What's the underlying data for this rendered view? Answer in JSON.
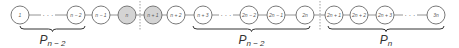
{
  "diagram": {
    "type": "path-graph",
    "node_radius": 9,
    "center_y": 15,
    "nodes": [
      {
        "label": "1",
        "x": 20,
        "shaded": false
      },
      {
        "label": "n − 2",
        "x": 76,
        "shaded": false
      },
      {
        "label": "n − 1",
        "x": 101,
        "shaded": false
      },
      {
        "label": "n",
        "x": 127,
        "shaded": true
      },
      {
        "label": "n + 1",
        "x": 153,
        "shaded": true
      },
      {
        "label": "n + 2",
        "x": 176,
        "shaded": false
      },
      {
        "label": "n + 3",
        "x": 203,
        "shaded": false
      },
      {
        "label": "2n − 2",
        "x": 249,
        "shaded": false
      },
      {
        "label": "2n − 1",
        "x": 276,
        "shaded": false
      },
      {
        "label": "2n",
        "x": 305,
        "shaded": false
      },
      {
        "label": "2n + 1",
        "x": 334,
        "shaded": false
      },
      {
        "label": "2n + 2",
        "x": 359,
        "shaded": false
      },
      {
        "label": "2n + 3",
        "x": 385,
        "shaded": false
      },
      {
        "label": "3n",
        "x": 436,
        "shaded": false
      }
    ],
    "ellipses": [
      {
        "label": "· · ·",
        "x": 48
      },
      {
        "label": "· · ·",
        "x": 226
      },
      {
        "label": "· · ·",
        "x": 410
      }
    ],
    "cut_lines": [
      {
        "x": 140
      },
      {
        "x": 320
      }
    ],
    "braces": [
      {
        "x1": 20,
        "x2": 85,
        "label_main": "P",
        "label_sub": "n − 2"
      },
      {
        "x1": 193,
        "x2": 310,
        "label_main": "P",
        "label_sub": "n − 2"
      },
      {
        "x1": 328,
        "x2": 444,
        "label_main": "P",
        "label_sub": "n"
      }
    ]
  }
}
